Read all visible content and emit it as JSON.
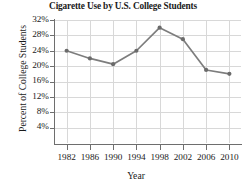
{
  "chart_data": {
    "type": "line",
    "title": "Cigarette Use by U.S. College Students",
    "xlabel": "Year",
    "ylabel": "Percent of College Students",
    "categories": [
      "1982",
      "1986",
      "1990",
      "1994",
      "1998",
      "2002",
      "2006",
      "2010"
    ],
    "x": [
      1982,
      1986,
      1990,
      1994,
      1998,
      2002,
      2006,
      2010
    ],
    "values": [
      24,
      22,
      20.5,
      24,
      30,
      27,
      19,
      18
    ],
    "series": [
      {
        "name": "Percent of College Students",
        "values": [
          24,
          22,
          20.5,
          24,
          30,
          27,
          19,
          18
        ]
      }
    ],
    "ylim": [
      0,
      32
    ],
    "xlim": [
      1980,
      2012
    ],
    "ytick_values": [
      4,
      8,
      12,
      16,
      20,
      24,
      28,
      32
    ],
    "ytick_labels": [
      "4%",
      "8%",
      "12%",
      "16%",
      "20%",
      "24%",
      "28%",
      "32%"
    ],
    "xtick_labels": [
      "1982",
      "1986",
      "1990",
      "1994",
      "1998",
      "2002",
      "2006",
      "2010"
    ],
    "grid": true,
    "legend": false,
    "line_color": "#7d7d7d",
    "marker_color": "#6b6b6b",
    "grid_color": "#d8d8d8",
    "axis_color": "#6e6e6e",
    "text_color": "#1a1a1a"
  },
  "source_note": ""
}
